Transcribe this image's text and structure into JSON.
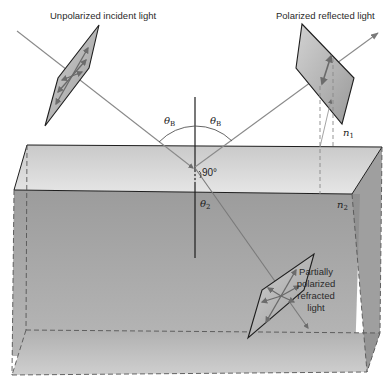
{
  "diagram": {
    "labels": {
      "incident": "Unpolarized incident light",
      "reflected": "Polarized reflected light",
      "refracted_line1": "Partially",
      "refracted_line2": "polarized",
      "refracted_line3": "refracted",
      "refracted_line4": "light",
      "theta_b_left": "θ",
      "theta_b_left_sub": "B",
      "theta_b_right": "θ",
      "theta_b_right_sub": "B",
      "theta_2": "θ",
      "theta_2_sub": "2",
      "right_angle": "90°",
      "n1": "n",
      "n1_sub": "1",
      "n2": "n",
      "n2_sub": "2"
    },
    "colors": {
      "background": "#ffffff",
      "box_top": "#d8d8d8",
      "box_front": "#a8a8a8",
      "box_bottom": "#c8c8c8",
      "box_side": "#909090",
      "ray": "#8a8a8a",
      "edge": "#1e1e1e",
      "plate": "#b4b4b4"
    }
  }
}
